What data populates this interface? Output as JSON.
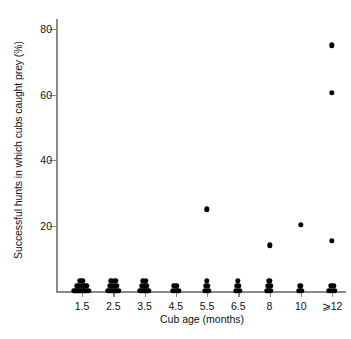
{
  "chart_data": {
    "type": "scatter",
    "title": "",
    "xlabel": "Cub age (months)",
    "ylabel": "Successful hunts in which cubs caught prey (%)",
    "categories": [
      "1.5",
      "2.5",
      "3.5",
      "4.5",
      "5.5",
      "6.5",
      "8",
      "10",
      "⩾12"
    ],
    "yticks": [
      20,
      40,
      60,
      80
    ],
    "ytick_labels": [
      "20",
      "40",
      "60",
      "80"
    ],
    "ylim": [
      0,
      80
    ],
    "grid": false,
    "legend": null,
    "marker": "filled-circle",
    "marker_color": "#000000",
    "axis_color": "#8a8a8a",
    "note": "Strip/dot plot; points jittered horizontally within each age category. Large zero-valued clusters at every age plus a few non-zero outliers.",
    "series": [
      {
        "name": "Successful hunts",
        "points": [
          {
            "category": "1.5",
            "jitter": -0.4,
            "value": 0
          },
          {
            "category": "1.5",
            "jitter": -0.3,
            "value": 0
          },
          {
            "category": "1.5",
            "jitter": -0.22,
            "value": 0
          },
          {
            "category": "1.5",
            "jitter": -0.14,
            "value": 0
          },
          {
            "category": "1.5",
            "jitter": -0.06,
            "value": 0
          },
          {
            "category": "1.5",
            "jitter": 0.02,
            "value": 0
          },
          {
            "category": "1.5",
            "jitter": 0.1,
            "value": 0
          },
          {
            "category": "1.5",
            "jitter": 0.18,
            "value": 0
          },
          {
            "category": "1.5",
            "jitter": 0.26,
            "value": 0
          },
          {
            "category": "1.5",
            "jitter": 0.34,
            "value": 0
          },
          {
            "category": "1.5",
            "jitter": -0.26,
            "value": 1.6
          },
          {
            "category": "1.5",
            "jitter": -0.16,
            "value": 1.6
          },
          {
            "category": "1.5",
            "jitter": -0.06,
            "value": 1.6
          },
          {
            "category": "1.5",
            "jitter": 0.06,
            "value": 1.6
          },
          {
            "category": "1.5",
            "jitter": 0.16,
            "value": 1.6
          },
          {
            "category": "1.5",
            "jitter": 0.26,
            "value": 1.6
          },
          {
            "category": "1.5",
            "jitter": -0.1,
            "value": 3.2
          },
          {
            "category": "1.5",
            "jitter": 0.02,
            "value": 3.2
          },
          {
            "category": "2.5",
            "jitter": -0.26,
            "value": 0
          },
          {
            "category": "2.5",
            "jitter": -0.17,
            "value": 0
          },
          {
            "category": "2.5",
            "jitter": -0.08,
            "value": 0
          },
          {
            "category": "2.5",
            "jitter": 0.01,
            "value": 0
          },
          {
            "category": "2.5",
            "jitter": 0.1,
            "value": 0
          },
          {
            "category": "2.5",
            "jitter": 0.19,
            "value": 0
          },
          {
            "category": "2.5",
            "jitter": 0.28,
            "value": 0
          },
          {
            "category": "2.5",
            "jitter": -0.18,
            "value": 1.6
          },
          {
            "category": "2.5",
            "jitter": -0.06,
            "value": 1.6
          },
          {
            "category": "2.5",
            "jitter": 0.06,
            "value": 1.6
          },
          {
            "category": "2.5",
            "jitter": 0.18,
            "value": 1.6
          },
          {
            "category": "2.5",
            "jitter": -0.1,
            "value": 3.2
          },
          {
            "category": "2.5",
            "jitter": 0.1,
            "value": 3.2
          },
          {
            "category": "3.5",
            "jitter": -0.22,
            "value": 0
          },
          {
            "category": "3.5",
            "jitter": -0.13,
            "value": 0
          },
          {
            "category": "3.5",
            "jitter": -0.04,
            "value": 0
          },
          {
            "category": "3.5",
            "jitter": 0.05,
            "value": 0
          },
          {
            "category": "3.5",
            "jitter": 0.14,
            "value": 0
          },
          {
            "category": "3.5",
            "jitter": 0.23,
            "value": 0
          },
          {
            "category": "3.5",
            "jitter": -0.14,
            "value": 1.6
          },
          {
            "category": "3.5",
            "jitter": -0.02,
            "value": 1.6
          },
          {
            "category": "3.5",
            "jitter": 0.1,
            "value": 1.6
          },
          {
            "category": "3.5",
            "jitter": -0.08,
            "value": 3.2
          },
          {
            "category": "3.5",
            "jitter": 0.08,
            "value": 3.2
          },
          {
            "category": "4.5",
            "jitter": -0.16,
            "value": 0
          },
          {
            "category": "4.5",
            "jitter": -0.06,
            "value": 0
          },
          {
            "category": "4.5",
            "jitter": 0.04,
            "value": 0
          },
          {
            "category": "4.5",
            "jitter": 0.14,
            "value": 0
          },
          {
            "category": "4.5",
            "jitter": -0.08,
            "value": 1.6
          },
          {
            "category": "4.5",
            "jitter": 0.06,
            "value": 1.6
          },
          {
            "category": "5.5",
            "jitter": -0.12,
            "value": 0
          },
          {
            "category": "5.5",
            "jitter": -0.02,
            "value": 0
          },
          {
            "category": "5.5",
            "jitter": 0.08,
            "value": 0
          },
          {
            "category": "5.5",
            "jitter": -0.06,
            "value": 1.6
          },
          {
            "category": "5.5",
            "jitter": 0.04,
            "value": 1.6
          },
          {
            "category": "5.5",
            "jitter": -0.02,
            "value": 3.2
          },
          {
            "category": "5.5",
            "jitter": 0.0,
            "value": 25.0
          },
          {
            "category": "6.5",
            "jitter": -0.12,
            "value": 0
          },
          {
            "category": "6.5",
            "jitter": -0.02,
            "value": 0
          },
          {
            "category": "6.5",
            "jitter": 0.08,
            "value": 0
          },
          {
            "category": "6.5",
            "jitter": -0.06,
            "value": 1.6
          },
          {
            "category": "6.5",
            "jitter": 0.04,
            "value": 1.6
          },
          {
            "category": "6.5",
            "jitter": -0.02,
            "value": 3.2
          },
          {
            "category": "8",
            "jitter": -0.12,
            "value": 0
          },
          {
            "category": "8",
            "jitter": -0.02,
            "value": 0
          },
          {
            "category": "8",
            "jitter": 0.08,
            "value": 0
          },
          {
            "category": "8",
            "jitter": -0.06,
            "value": 1.6
          },
          {
            "category": "8",
            "jitter": 0.04,
            "value": 1.6
          },
          {
            "category": "8",
            "jitter": -0.02,
            "value": 3.2
          },
          {
            "category": "8",
            "jitter": 0.0,
            "value": 14.0
          },
          {
            "category": "10",
            "jitter": -0.07,
            "value": 0
          },
          {
            "category": "10",
            "jitter": 0.03,
            "value": 0
          },
          {
            "category": "10",
            "jitter": -0.02,
            "value": 1.6
          },
          {
            "category": "10",
            "jitter": 0.0,
            "value": 20.2
          },
          {
            "category": "⩾12",
            "jitter": -0.16,
            "value": 0
          },
          {
            "category": "⩾12",
            "jitter": -0.06,
            "value": 0
          },
          {
            "category": "⩾12",
            "jitter": 0.04,
            "value": 0
          },
          {
            "category": "⩾12",
            "jitter": 0.14,
            "value": 0
          },
          {
            "category": "⩾12",
            "jitter": -0.06,
            "value": 1.6
          },
          {
            "category": "⩾12",
            "jitter": 0.06,
            "value": 1.6
          },
          {
            "category": "⩾12",
            "jitter": 0.0,
            "value": 15.3
          },
          {
            "category": "⩾12",
            "jitter": 0.0,
            "value": 60.6
          },
          {
            "category": "⩾12",
            "jitter": 0.0,
            "value": 75.0
          }
        ]
      }
    ]
  }
}
